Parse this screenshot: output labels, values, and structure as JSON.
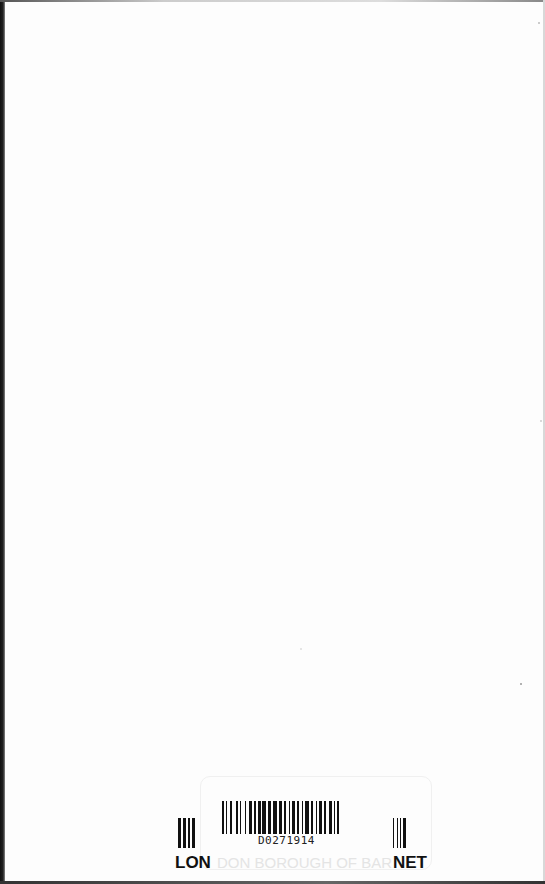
{
  "document": {
    "type": "book end page with library label",
    "background": "#fdfdfd"
  },
  "library_label": {
    "barcode_number": "D0271914",
    "label_prefix": "LON",
    "label_middle": "DON BOROUGH OF BAR",
    "label_suffix": "NET",
    "full_label": "LONDON BOROUGH OF BARNET",
    "faint_header": "",
    "colors": {
      "ink": "#111111",
      "faint": "#e4e4e4"
    }
  },
  "icons": {
    "barcode": "barcode-icon"
  }
}
